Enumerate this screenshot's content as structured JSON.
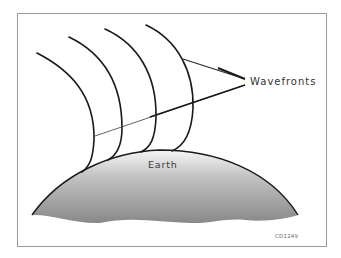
{
  "figure": {
    "labels": {
      "wavefronts": "Wavefronts",
      "earth": "Earth",
      "figure_code": "CD1249"
    },
    "wavefront_count": 4,
    "colors": {
      "line": "#1a1a1a",
      "leader": "#2a2a2a",
      "earth_top": "#f4f4f4",
      "earth_bottom": "#8a8a8a",
      "frame_border": "#9a9a9a",
      "background": "#ffffff"
    }
  }
}
